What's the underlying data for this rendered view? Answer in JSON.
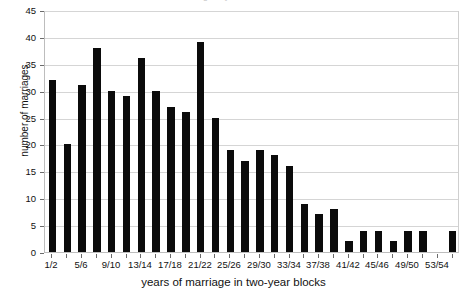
{
  "chart_data": {
    "type": "bar",
    "title": "Marriages by time lived in…",
    "xlabel": "years of marriage in two-year blocks",
    "ylabel": "number of marriages",
    "ylim": [
      0,
      45
    ],
    "ytick_step": 5,
    "yticks": [
      0,
      5,
      10,
      15,
      20,
      25,
      30,
      35,
      40,
      45
    ],
    "grid": true,
    "legend": "none",
    "bar_color": "#0b0b0b",
    "categories": [
      "1/2",
      "3/4",
      "5/6",
      "7/8",
      "9/10",
      "11/12",
      "13/14",
      "15/16",
      "17/18",
      "19/20",
      "21/22",
      "23/24",
      "25/26",
      "27/28",
      "29/30",
      "31/32",
      "33/34",
      "35/36",
      "37/38",
      "39/40",
      "41/42",
      "43/44",
      "45/46",
      "47/48",
      "49/50",
      "51/52",
      "53/54",
      "55/56"
    ],
    "xtick_labels": [
      "1/2",
      "5/6",
      "9/10",
      "13/14",
      "17/18",
      "21/22",
      "25/26",
      "29/30",
      "33/34",
      "37/38",
      "41/42",
      "45/46",
      "49/50",
      "53/54"
    ],
    "values": [
      32,
      20,
      31,
      38,
      30,
      29,
      36,
      30,
      27,
      26,
      39,
      25,
      19,
      17,
      19,
      18,
      16,
      9,
      7,
      8,
      2,
      4,
      4,
      2,
      4,
      4,
      0,
      4
    ]
  }
}
